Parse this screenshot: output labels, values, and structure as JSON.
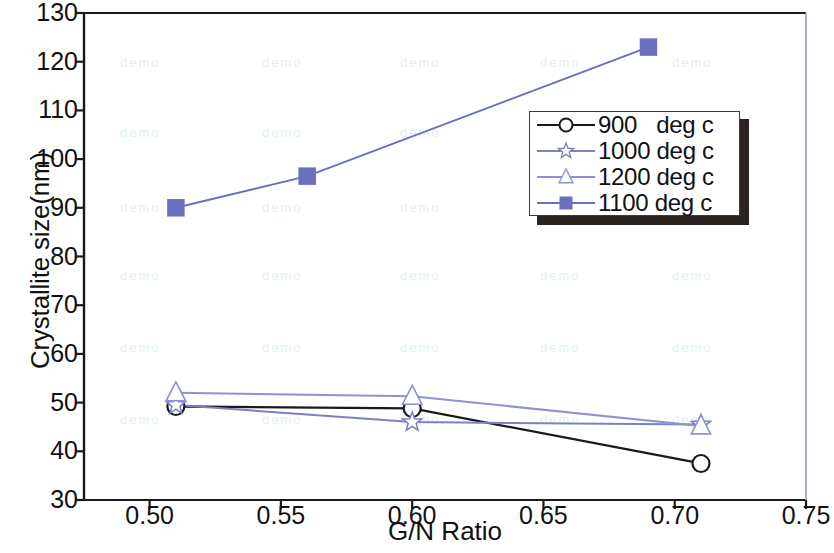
{
  "chart_data": {
    "type": "line",
    "title": "",
    "xlabel": "G/N Ratio",
    "ylabel": "Crystallite size(nm)",
    "xlim": [
      0.475,
      0.75
    ],
    "ylim": [
      30,
      130
    ],
    "xticks": [
      "0.50",
      "0.55",
      "0.60",
      "0.65",
      "0.70",
      "0.75"
    ],
    "xtick_values": [
      0.5,
      0.55,
      0.6,
      0.65,
      0.7,
      0.75
    ],
    "yticks": [
      "30",
      "40",
      "50",
      "60",
      "70",
      "80",
      "90",
      "100",
      "110",
      "120",
      "130"
    ],
    "ytick_values": [
      30,
      40,
      50,
      60,
      70,
      80,
      90,
      100,
      110,
      120,
      130
    ],
    "grid": false,
    "legend_position": "upper-right",
    "series": [
      {
        "name": "900   deg c",
        "label": "900   deg c",
        "marker": "circle-open",
        "color": "#1a1a1a",
        "x": [
          0.51,
          0.6,
          0.71
        ],
        "y": [
          49.2,
          48.8,
          37.5
        ]
      },
      {
        "name": "1000 deg c",
        "label": "1000 deg c",
        "marker": "star-open",
        "color": "#7b7fc4",
        "x": [
          0.51,
          0.6,
          0.71
        ],
        "y": [
          49.5,
          46.0,
          45.5
        ]
      },
      {
        "name": "1200 deg c",
        "label": "1200 deg c",
        "marker": "triangle-open",
        "color": "#8e92d0",
        "x": [
          0.51,
          0.6,
          0.71
        ],
        "y": [
          52.0,
          51.3,
          45.2
        ]
      },
      {
        "name": "1100 deg c",
        "label": "1100 deg c",
        "marker": "square-filled",
        "color": "#6b6fc0",
        "x": [
          0.51,
          0.56,
          0.69
        ],
        "y": [
          90.0,
          96.5,
          123.0
        ]
      }
    ]
  },
  "axes": {
    "frame_color": "#1a1a1a",
    "right_border_color": "#9ea2d8"
  },
  "watermark": {
    "text": "demo",
    "color": "#e3f3ec"
  }
}
